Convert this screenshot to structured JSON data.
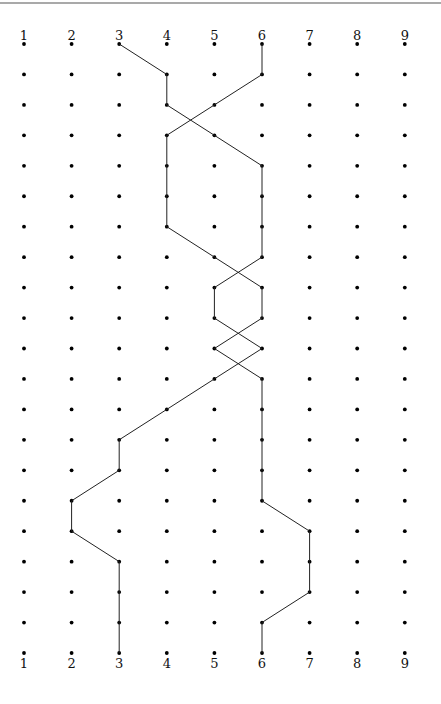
{
  "diagram": {
    "title": "",
    "columns": [
      "1",
      "2",
      "3",
      "4",
      "5",
      "6",
      "7",
      "8",
      "9"
    ],
    "row_count": 21,
    "top_labels": [
      "1",
      "2",
      "3",
      "4",
      "5",
      "6",
      "7",
      "8",
      "9"
    ],
    "bottom_labels": [
      "1",
      "2",
      "3",
      "4",
      "5",
      "6",
      "7",
      "8",
      "9"
    ],
    "paths": [
      {
        "name": "path-from-3",
        "start_label": "3",
        "end_label": "3",
        "columns_by_row": [
          3,
          4,
          4,
          5,
          6,
          6,
          6,
          6,
          5,
          5,
          6,
          5,
          4,
          3,
          3,
          2,
          2,
          3,
          3,
          3,
          3
        ]
      },
      {
        "name": "path-from-6",
        "start_label": "6",
        "end_label": "6",
        "columns_by_row": [
          6,
          6,
          5,
          4,
          4,
          4,
          4,
          5,
          6,
          6,
          5,
          6,
          6,
          6,
          6,
          6,
          7,
          7,
          7,
          6,
          6
        ]
      }
    ],
    "colors": {
      "dot": "#000000",
      "line": "#222222",
      "background": "#ffffff"
    }
  }
}
